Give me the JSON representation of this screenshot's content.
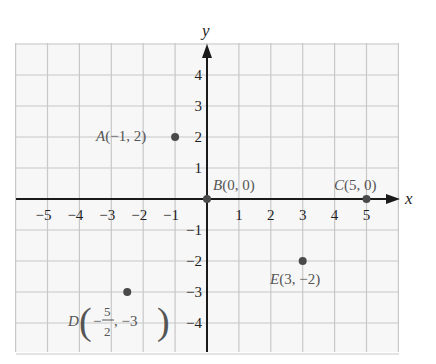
{
  "chart_data": {
    "type": "scatter",
    "title": "",
    "xlabel": "x",
    "ylabel": "y",
    "xlim": [
      -6,
      6
    ],
    "ylim": [
      -5,
      5
    ],
    "grid": true,
    "x_ticks": [
      -5,
      -4,
      -3,
      -2,
      -1,
      1,
      2,
      3,
      4,
      5
    ],
    "y_ticks": [
      -4,
      -3,
      -2,
      -1,
      1,
      2,
      3,
      4
    ],
    "x_tick_labels": [
      "−5",
      "−4",
      "−3",
      "−2",
      "−1",
      "1",
      "2",
      "3",
      "4",
      "5"
    ],
    "y_tick_labels": [
      "−4",
      "−3",
      "−2",
      "−1",
      "1",
      "2",
      "3",
      "4"
    ],
    "points": [
      {
        "name": "A",
        "x": -1,
        "y": 2,
        "label": "A(−1, 2)"
      },
      {
        "name": "B",
        "x": 0,
        "y": 0,
        "label": "B(0, 0)"
      },
      {
        "name": "C",
        "x": 5,
        "y": 0,
        "label": "C(5, 0)"
      },
      {
        "name": "D",
        "x": -2.5,
        "y": -3,
        "label": "D(−5/2, −3)"
      },
      {
        "name": "E",
        "x": 3,
        "y": -2,
        "label": "E(3, −2)"
      }
    ]
  },
  "labels": {
    "x_axis": "x",
    "y_axis": "y",
    "A": {
      "letter": "A",
      "coords": "(−1, 2)"
    },
    "B": {
      "letter": "B",
      "coords": "(0, 0)"
    },
    "C": {
      "letter": "C",
      "coords": "(5, 0)"
    },
    "D": {
      "letter": "D",
      "neg": "−",
      "num": "5",
      "den": "2",
      "rest": ", −3"
    },
    "E": {
      "letter": "E",
      "coords": "(3, −2)"
    }
  },
  "colors": {
    "grid": "#c8c8c8",
    "grid_bg": "#f7f7f7",
    "axis": "#1a1a1a",
    "point": "#4a4a4a",
    "label": "#555555"
  }
}
